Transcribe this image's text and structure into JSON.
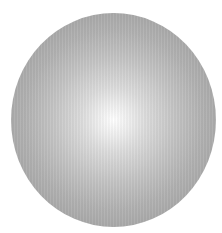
{
  "image": {
    "subject": "gray shaded sphere",
    "shape": "circle",
    "colors": {
      "background": "#ffffff",
      "highlight": "#ffffff",
      "mid": "#c6c6c6",
      "edge": "#9b9b9b"
    }
  }
}
